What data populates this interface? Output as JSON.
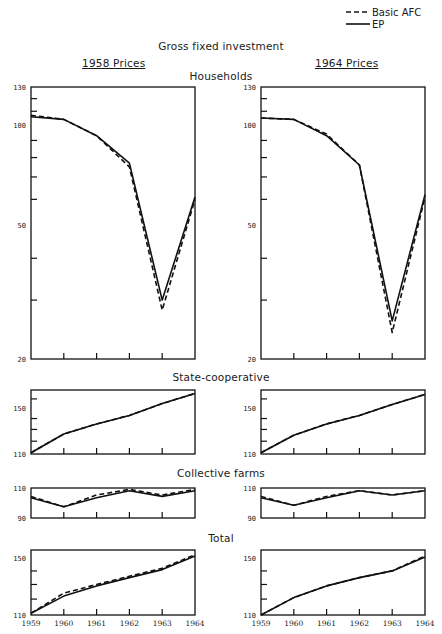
{
  "legend": {
    "items": [
      {
        "label": "Basic AFC",
        "style": "dashed"
      },
      {
        "label": "EP",
        "style": "solid"
      }
    ]
  },
  "header": {
    "title": "Gross fixed investment",
    "left_column": "1958 Prices",
    "right_column": "1964 Prices"
  },
  "sections": {
    "households": "Households",
    "state_coop": "State-cooperative",
    "collective": "Collective farms",
    "total": "Total"
  },
  "chart_data": [
    {
      "type": "line",
      "title": "Households — 1958 Prices",
      "x": [
        1959,
        1960,
        1961,
        1962,
        1963,
        1964
      ],
      "series": [
        {
          "name": "Basic AFC",
          "values": [
            107,
            104,
            93,
            75,
            28,
            60
          ]
        },
        {
          "name": "EP",
          "values": [
            106,
            104,
            93,
            77,
            30,
            61
          ]
        }
      ],
      "yscale": "log",
      "ylim": [
        20,
        130
      ],
      "yticks": [
        20,
        50,
        100,
        130
      ],
      "grid": false
    },
    {
      "type": "line",
      "title": "Households — 1964 Prices",
      "x": [
        1959,
        1960,
        1961,
        1962,
        1963,
        1964
      ],
      "series": [
        {
          "name": "Basic AFC",
          "values": [
            105,
            104,
            94,
            76,
            24,
            61
          ]
        },
        {
          "name": "EP",
          "values": [
            105,
            104,
            93,
            76,
            26,
            62
          ]
        }
      ],
      "yscale": "log",
      "ylim": [
        20,
        130
      ],
      "yticks": [
        20,
        50,
        100,
        130
      ],
      "grid": false
    },
    {
      "type": "line",
      "title": "State-cooperative — 1958 Prices",
      "x": [
        1959,
        1960,
        1961,
        1962,
        1963,
        1964
      ],
      "series": [
        {
          "name": "Basic AFC",
          "values": [
            111,
            126,
            135,
            143,
            155,
            166
          ]
        },
        {
          "name": "EP",
          "values": [
            111,
            126,
            135,
            143,
            155,
            166
          ]
        }
      ],
      "yscale": "log",
      "ylim": [
        110,
        170
      ],
      "yticks": [
        110,
        150
      ],
      "grid": false
    },
    {
      "type": "line",
      "title": "State-cooperative — 1964 Prices",
      "x": [
        1959,
        1960,
        1961,
        1962,
        1963,
        1964
      ],
      "series": [
        {
          "name": "Basic AFC",
          "values": [
            111,
            125,
            135,
            143,
            154,
            165
          ]
        },
        {
          "name": "EP",
          "values": [
            111,
            125,
            135,
            143,
            154,
            165
          ]
        }
      ],
      "yscale": "log",
      "ylim": [
        110,
        170
      ],
      "yticks": [
        110,
        150
      ],
      "grid": false
    },
    {
      "type": "line",
      "title": "Collective farms — 1958 Prices",
      "x": [
        1959,
        1960,
        1961,
        1962,
        1963,
        1964
      ],
      "series": [
        {
          "name": "Basic AFC",
          "values": [
            104,
            97,
            105,
            109,
            105,
            109
          ]
        },
        {
          "name": "EP",
          "values": [
            103,
            97,
            103,
            108,
            104,
            108
          ]
        }
      ],
      "yscale": "log",
      "ylim": [
        90,
        110
      ],
      "yticks": [
        90,
        110
      ],
      "grid": false
    },
    {
      "type": "line",
      "title": "Collective farms — 1964 Prices",
      "x": [
        1959,
        1960,
        1961,
        1962,
        1963,
        1964
      ],
      "series": [
        {
          "name": "Basic AFC",
          "values": [
            104,
            98,
            104,
            108,
            105,
            108
          ]
        },
        {
          "name": "EP",
          "values": [
            103,
            98,
            103,
            108,
            105,
            108
          ]
        }
      ],
      "yscale": "log",
      "ylim": [
        90,
        110
      ],
      "yticks": [
        90,
        110
      ],
      "grid": false
    },
    {
      "type": "line",
      "title": "Total — 1958 Prices",
      "x": [
        1959,
        1960,
        1961,
        1962,
        1963,
        1964
      ],
      "series": [
        {
          "name": "Basic AFC",
          "values": [
            111,
            124,
            130,
            136,
            142,
            153
          ]
        },
        {
          "name": "EP",
          "values": [
            111,
            122,
            129,
            135,
            141,
            152
          ]
        }
      ],
      "yscale": "log",
      "ylim": [
        110,
        157
      ],
      "yticks": [
        110,
        150
      ],
      "xlabel": "",
      "grid": false
    },
    {
      "type": "line",
      "title": "Total — 1964 Prices",
      "x": [
        1959,
        1960,
        1961,
        1962,
        1963,
        1964
      ],
      "series": [
        {
          "name": "Basic AFC",
          "values": [
            110,
            121,
            129,
            135,
            140,
            152
          ]
        },
        {
          "name": "EP",
          "values": [
            110,
            121,
            129,
            135,
            140,
            151
          ]
        }
      ],
      "yscale": "log",
      "ylim": [
        110,
        157
      ],
      "yticks": [
        110,
        150
      ],
      "xlabel": "",
      "grid": false
    }
  ],
  "x_tick_labels": [
    "1959",
    "1960",
    "1961",
    "1962",
    "1963",
    "1964"
  ]
}
